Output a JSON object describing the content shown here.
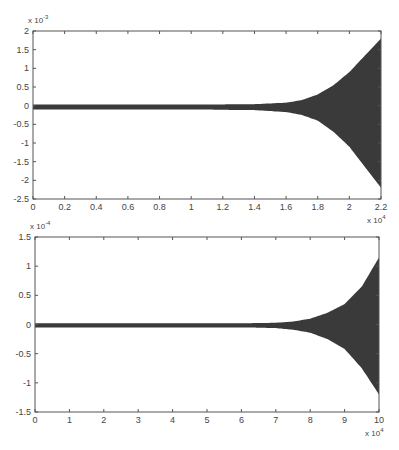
{
  "chart_data": [
    {
      "type": "area",
      "title": "",
      "xlabel": "",
      "ylabel": "",
      "x_multiplier": "x 10^4",
      "y_multiplier": "x 10^-3",
      "xlim": [
        0,
        2.2
      ],
      "ylim": [
        -2.5,
        2
      ],
      "xticks": [
        "0",
        "0.2",
        "0.4",
        "0.6",
        "0.8",
        "1",
        "1.2",
        "1.4",
        "1.6",
        "1.8",
        "2",
        "2.2"
      ],
      "yticks": [
        "2",
        "1.5",
        "1",
        "0.5",
        "0",
        "-0.5",
        "-1",
        "-1.5",
        "-2",
        "-2.5"
      ],
      "grid": false,
      "description": "Dense oscillating signal; envelope near zero (about ±0.05e-3) until ~1.5e4, then growing rapidly",
      "series": [
        {
          "name": "upper envelope",
          "x": [
            0,
            0.5,
            1.0,
            1.4,
            1.6,
            1.7,
            1.8,
            1.9,
            2.0,
            2.1,
            2.2
          ],
          "values": [
            0.03,
            0.03,
            0.03,
            0.04,
            0.08,
            0.15,
            0.3,
            0.55,
            0.9,
            1.35,
            1.8
          ]
        },
        {
          "name": "lower envelope",
          "x": [
            0,
            0.5,
            1.0,
            1.4,
            1.6,
            1.7,
            1.8,
            1.9,
            2.0,
            2.1,
            2.2
          ],
          "values": [
            -0.1,
            -0.1,
            -0.1,
            -0.12,
            -0.17,
            -0.25,
            -0.4,
            -0.7,
            -1.1,
            -1.65,
            -2.2
          ]
        }
      ]
    },
    {
      "type": "area",
      "title": "",
      "xlabel": "",
      "ylabel": "",
      "x_multiplier": "x 10^4",
      "y_multiplier": "x 10^-4",
      "xlim": [
        0,
        10
      ],
      "ylim": [
        -1.5,
        1.5
      ],
      "xticks": [
        "0",
        "1",
        "2",
        "3",
        "4",
        "5",
        "6",
        "7",
        "8",
        "9",
        "10"
      ],
      "yticks": [
        "1.5",
        "1",
        "0.5",
        "0",
        "-0.5",
        "-1",
        "-1.5"
      ],
      "grid": false,
      "description": "Dense oscillating signal; envelope near zero until ~7e4, then growing rapidly",
      "series": [
        {
          "name": "upper envelope",
          "x": [
            0,
            3,
            6,
            7,
            7.5,
            8,
            8.5,
            9,
            9.5,
            10
          ],
          "values": [
            0.02,
            0.02,
            0.02,
            0.03,
            0.05,
            0.1,
            0.2,
            0.35,
            0.65,
            1.15
          ]
        },
        {
          "name": "lower envelope",
          "x": [
            0,
            3,
            6,
            7,
            7.5,
            8,
            8.5,
            9,
            9.5,
            10
          ],
          "values": [
            -0.05,
            -0.05,
            -0.05,
            -0.06,
            -0.09,
            -0.14,
            -0.25,
            -0.42,
            -0.75,
            -1.2
          ]
        }
      ]
    }
  ],
  "plots": [
    {
      "exp_base": "x 10",
      "y_exp": "-3",
      "x_exp": "4"
    },
    {
      "exp_base": "x 10",
      "y_exp": "-4",
      "x_exp": "4"
    }
  ],
  "colors": {
    "fill": "#3a3a3a",
    "axis": "#555555",
    "background": "#ffffff"
  }
}
